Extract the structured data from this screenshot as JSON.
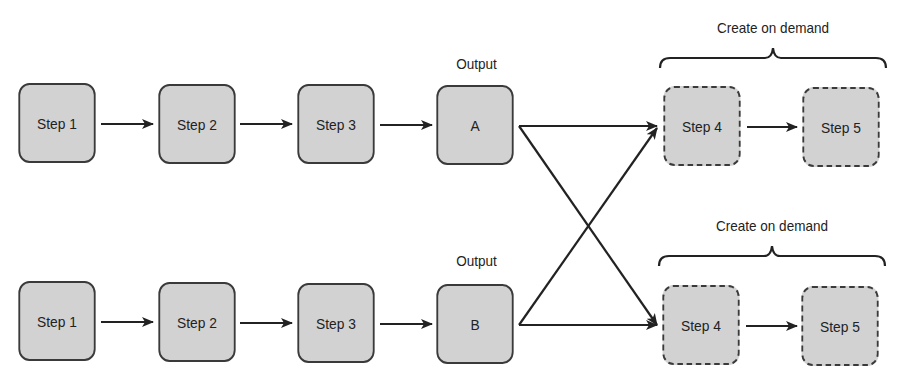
{
  "diagram": {
    "colors": {
      "box_fill": "#d2d2d2",
      "stroke": "#222222"
    },
    "row_top": {
      "steps": [
        {
          "id": "top-step-1",
          "label": "Step 1"
        },
        {
          "id": "top-step-2",
          "label": "Step 2"
        },
        {
          "id": "top-step-3",
          "label": "Step 3"
        },
        {
          "id": "output-a",
          "label": "A"
        }
      ],
      "output_caption": "Output",
      "on_demand": {
        "caption": "Create on demand",
        "steps": [
          {
            "id": "top-step-4",
            "label": "Step 4"
          },
          {
            "id": "top-step-5",
            "label": "Step 5"
          }
        ]
      }
    },
    "row_bottom": {
      "steps": [
        {
          "id": "bottom-step-1",
          "label": "Step 1"
        },
        {
          "id": "bottom-step-2",
          "label": "Step 2"
        },
        {
          "id": "bottom-step-3",
          "label": "Step 3"
        },
        {
          "id": "output-b",
          "label": "B"
        }
      ],
      "output_caption": "Output",
      "on_demand": {
        "caption": "Create on demand",
        "steps": [
          {
            "id": "bottom-step-4",
            "label": "Step 4"
          },
          {
            "id": "bottom-step-5",
            "label": "Step 5"
          }
        ]
      }
    },
    "edges": [
      [
        "top-step-1",
        "top-step-2"
      ],
      [
        "top-step-2",
        "top-step-3"
      ],
      [
        "top-step-3",
        "output-a"
      ],
      [
        "output-a",
        "top-step-4"
      ],
      [
        "output-a",
        "bottom-step-4"
      ],
      [
        "top-step-4",
        "top-step-5"
      ],
      [
        "bottom-step-1",
        "bottom-step-2"
      ],
      [
        "bottom-step-2",
        "bottom-step-3"
      ],
      [
        "bottom-step-3",
        "output-b"
      ],
      [
        "output-b",
        "bottom-step-4"
      ],
      [
        "output-b",
        "top-step-4"
      ],
      [
        "bottom-step-4",
        "bottom-step-5"
      ]
    ]
  }
}
